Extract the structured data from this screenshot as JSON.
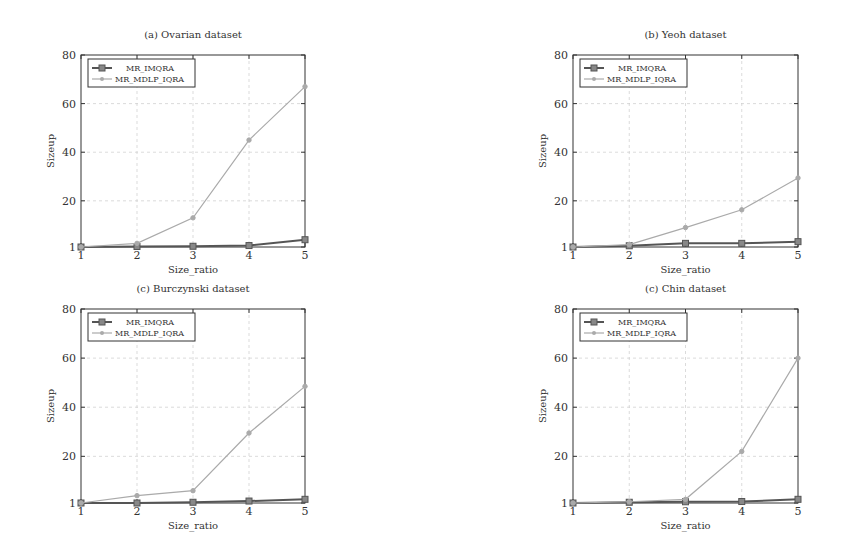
{
  "figure": {
    "legend": [
      "MR_IMQRA",
      "MR_MDLP_IQRA"
    ],
    "colors": {
      "MR_IMQRA": "#555555",
      "MR_MDLP_IQRA": "#aaaaaa",
      "axis": "#333333",
      "grid": "#cccccc"
    }
  },
  "chart_data": [
    {
      "type": "line",
      "title": "(a) Ovarian dataset",
      "xlabel": "Size_ratio",
      "ylabel": "Sizeup",
      "x": [
        1,
        2,
        3,
        4,
        5
      ],
      "xticks": [
        1,
        2,
        3,
        4,
        5
      ],
      "yticks": [
        1,
        20,
        40,
        60,
        80
      ],
      "ylim": [
        1,
        80
      ],
      "grid": true,
      "legend_position": "upper left",
      "series": [
        {
          "name": "MR_IMQRA",
          "values": [
            1,
            1.2,
            1.3,
            1.6,
            4
          ]
        },
        {
          "name": "MR_MDLP_IQRA",
          "values": [
            1,
            2.5,
            13,
            45,
            67
          ]
        }
      ]
    },
    {
      "type": "line",
      "title": "(b) Yeoh dataset",
      "xlabel": "Size_ratio",
      "ylabel": "Sizeup",
      "x": [
        1,
        2,
        3,
        4,
        5
      ],
      "xticks": [
        1,
        2,
        3,
        4,
        5
      ],
      "yticks": [
        1,
        20,
        40,
        60,
        80
      ],
      "ylim": [
        1,
        80
      ],
      "grid": true,
      "legend_position": "upper left",
      "series": [
        {
          "name": "MR_IMQRA",
          "values": [
            1,
            1.5,
            2.5,
            2.5,
            3.2
          ]
        },
        {
          "name": "MR_MDLP_IQRA",
          "values": [
            1,
            2,
            9,
            16.3,
            29.4
          ]
        }
      ]
    },
    {
      "type": "line",
      "title": "(c) Burczynski dataset",
      "xlabel": "Size_ratio",
      "ylabel": "Sizeup",
      "x": [
        1,
        2,
        3,
        4,
        5
      ],
      "xticks": [
        1,
        2,
        3,
        4,
        5
      ],
      "yticks": [
        1,
        20,
        40,
        60,
        80
      ],
      "ylim": [
        1,
        80
      ],
      "grid": true,
      "legend_position": "upper left",
      "series": [
        {
          "name": "MR_IMQRA",
          "values": [
            1,
            1,
            1.3,
            1.8,
            2.5
          ]
        },
        {
          "name": "MR_MDLP_IQRA",
          "values": [
            1,
            4,
            6,
            29.5,
            48.5
          ]
        }
      ]
    },
    {
      "type": "line",
      "title": "(c) Chin dataset",
      "xlabel": "Size_ratio",
      "ylabel": "Sizeup",
      "x": [
        1,
        2,
        3,
        4,
        5
      ],
      "xticks": [
        1,
        2,
        3,
        4,
        5
      ],
      "yticks": [
        1,
        20,
        40,
        60,
        80
      ],
      "ylim": [
        1,
        80
      ],
      "grid": true,
      "legend_position": "upper left",
      "series": [
        {
          "name": "MR_IMQRA",
          "values": [
            1,
            1.3,
            1.5,
            1.6,
            2.5
          ]
        },
        {
          "name": "MR_MDLP_IQRA",
          "values": [
            1,
            1.5,
            2.5,
            22,
            60
          ]
        }
      ]
    }
  ]
}
